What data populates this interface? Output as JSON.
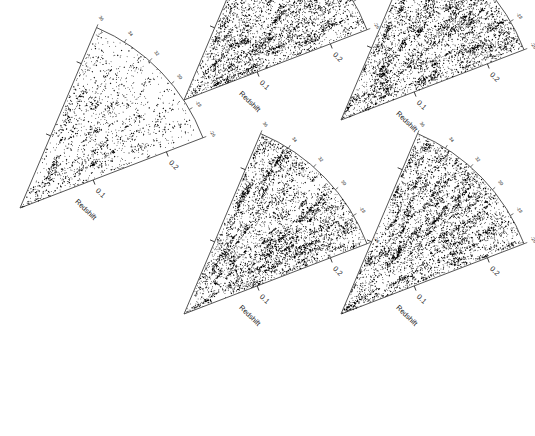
{
  "figure": {
    "background_color": "#ffffff",
    "ink_color": "#000000",
    "width": 502,
    "height": 436,
    "panel_count": 5
  },
  "axes": {
    "radial_axis_title": "Redshift",
    "radial_tick_labels": [
      "0.1",
      "0.2"
    ],
    "radial_tick_values": [
      0.1,
      0.2
    ],
    "angular_tick_labels": [
      "36",
      "34",
      "32",
      "30",
      "-28",
      "-26"
    ],
    "radial_min": 0.0,
    "radial_max": 0.25
  },
  "panels": [
    {
      "id": "panel-observed",
      "name": "observed-survey-wedge",
      "position": "left",
      "x": 14,
      "y": 112,
      "density": 0.62,
      "clump": 0.55,
      "seed": 11,
      "radial_falloff": true
    },
    {
      "id": "panel-mock-1",
      "name": "mock-catalogue-wedge-1",
      "position": "top-middle",
      "x": 178,
      "y": 4,
      "density": 1.0,
      "clump": 0.95,
      "seed": 23,
      "radial_falloff": false
    },
    {
      "id": "panel-mock-2",
      "name": "mock-catalogue-wedge-2",
      "position": "top-right",
      "x": 335,
      "y": 24,
      "density": 0.95,
      "clump": 0.88,
      "seed": 37,
      "radial_falloff": false
    },
    {
      "id": "panel-mock-3",
      "name": "mock-catalogue-wedge-3",
      "position": "bottom-middle",
      "x": 178,
      "y": 218,
      "density": 1.0,
      "clump": 0.92,
      "seed": 53,
      "radial_falloff": false
    },
    {
      "id": "panel-mock-4",
      "name": "mock-catalogue-wedge-4",
      "position": "bottom-right",
      "x": 335,
      "y": 218,
      "density": 0.97,
      "clump": 0.9,
      "seed": 71,
      "radial_falloff": false
    }
  ],
  "chart_data": {
    "type": "scatter",
    "title": "",
    "subtitle": "",
    "xlabel": "Redshift",
    "ylabel": "",
    "projection": "polar-wedge",
    "panel_layout": "1 left + 2x2 right",
    "xlim": [
      0.0,
      0.25
    ],
    "angular_range_deg": [
      26,
      36
    ],
    "grid": false,
    "legend": null,
    "series": [
      {
        "name": "observed-survey-wedge",
        "point_style": "dot",
        "color": "#000000",
        "relative_density": 0.62,
        "clustering_strength": 0.55,
        "note": "sparser at high redshift"
      },
      {
        "name": "mock-catalogue-wedge-1",
        "point_style": "dot",
        "color": "#000000",
        "relative_density": 1.0,
        "clustering_strength": 0.95
      },
      {
        "name": "mock-catalogue-wedge-2",
        "point_style": "dot",
        "color": "#000000",
        "relative_density": 0.95,
        "clustering_strength": 0.88
      },
      {
        "name": "mock-catalogue-wedge-3",
        "point_style": "dot",
        "color": "#000000",
        "relative_density": 1.0,
        "clustering_strength": 0.92
      },
      {
        "name": "mock-catalogue-wedge-4",
        "point_style": "dot",
        "color": "#000000",
        "relative_density": 0.97,
        "clustering_strength": 0.9
      }
    ],
    "xticks": [
      0.1,
      0.2
    ],
    "xticklabels": [
      "0.1",
      "0.2"
    ],
    "angular_ticks": [
      36,
      34,
      32,
      30,
      28,
      26
    ],
    "angular_ticklabels": [
      "36",
      "34",
      "32",
      "30",
      "-28",
      "-26"
    ]
  }
}
